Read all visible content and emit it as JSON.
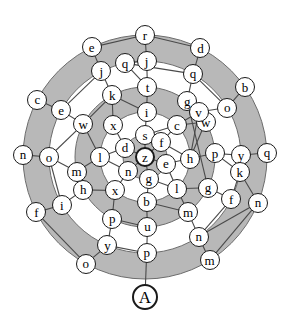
{
  "figure": {
    "colors": {
      "ring_fill": "#b8b8b8",
      "background": "#ffffff",
      "node_fill": "#ffffff",
      "stroke": "#1a1a1a"
    },
    "center": {
      "x": 145,
      "y": 157
    },
    "ring_radii": [
      0,
      22,
      45,
      70,
      96,
      122
    ],
    "goal_radius": 140
  },
  "nodes": [
    {
      "id": "n0",
      "label": "z",
      "ring": 0,
      "angle": 0,
      "bold": true,
      "goal": false
    },
    {
      "id": "n1",
      "label": "s",
      "ring": 1,
      "angle": 270,
      "bold": false,
      "goal": false
    },
    {
      "id": "n2",
      "label": "f",
      "ring": 1,
      "angle": 318,
      "bold": false,
      "goal": false
    },
    {
      "id": "n3",
      "label": "e",
      "ring": 1,
      "angle": 18,
      "bold": false,
      "goal": false
    },
    {
      "id": "n4",
      "label": "g",
      "ring": 1,
      "angle": 80,
      "bold": false,
      "goal": false
    },
    {
      "id": "n5",
      "label": "n",
      "ring": 1,
      "angle": 140,
      "bold": false,
      "goal": false
    },
    {
      "id": "n6",
      "label": "d",
      "ring": 1,
      "angle": 205,
      "bold": false,
      "goal": false
    },
    {
      "id": "n7",
      "label": "i",
      "ring": 2,
      "angle": 272,
      "bold": false,
      "goal": false
    },
    {
      "id": "n8",
      "label": "c",
      "ring": 2,
      "angle": 315,
      "bold": false,
      "goal": false
    },
    {
      "id": "n9",
      "label": "h",
      "ring": 2,
      "angle": 2,
      "bold": false,
      "goal": false
    },
    {
      "id": "n10",
      "label": "l",
      "ring": 2,
      "angle": 45,
      "bold": false,
      "goal": false
    },
    {
      "id": "n11",
      "label": "b",
      "ring": 2,
      "angle": 88,
      "bold": false,
      "goal": false
    },
    {
      "id": "n12",
      "label": "x",
      "ring": 2,
      "angle": 132,
      "bold": false,
      "goal": false
    },
    {
      "id": "n13",
      "label": "l",
      "ring": 2,
      "angle": 180,
      "bold": false,
      "goal": false
    },
    {
      "id": "n14",
      "label": "x",
      "ring": 2,
      "angle": 225,
      "bold": false,
      "goal": false
    },
    {
      "id": "n15",
      "label": "t",
      "ring": 3,
      "angle": 272,
      "bold": false,
      "goal": false
    },
    {
      "id": "n16",
      "label": "g",
      "ring": 3,
      "angle": 307,
      "bold": false,
      "goal": false
    },
    {
      "id": "n17",
      "label": "w",
      "ring": 3,
      "angle": 330,
      "bold": false,
      "goal": false
    },
    {
      "id": "n18",
      "label": "p",
      "ring": 3,
      "angle": 357,
      "bold": false,
      "goal": false
    },
    {
      "id": "n19",
      "label": "g",
      "ring": 3,
      "angle": 26,
      "bold": false,
      "goal": false
    },
    {
      "id": "n20",
      "label": "m",
      "ring": 3,
      "angle": 52,
      "bold": false,
      "goal": false
    },
    {
      "id": "n21",
      "label": "u",
      "ring": 3,
      "angle": 88,
      "bold": false,
      "goal": false
    },
    {
      "id": "n22",
      "label": "p",
      "ring": 3,
      "angle": 118,
      "bold": false,
      "goal": false
    },
    {
      "id": "n23",
      "label": "h",
      "ring": 3,
      "angle": 152,
      "bold": false,
      "goal": false
    },
    {
      "id": "n24",
      "label": "m",
      "ring": 3,
      "angle": 168,
      "bold": false,
      "goal": false
    },
    {
      "id": "n25",
      "label": "w",
      "ring": 3,
      "angle": 208,
      "bold": false,
      "goal": false
    },
    {
      "id": "n26",
      "label": "k",
      "ring": 3,
      "angle": 242,
      "bold": false,
      "goal": false
    },
    {
      "id": "n27",
      "label": "v",
      "ring": 3,
      "angle": 320,
      "bold": false,
      "goal": false
    },
    {
      "id": "n28",
      "label": "j",
      "ring": 4,
      "angle": 271,
      "bold": false,
      "goal": false
    },
    {
      "id": "n29",
      "label": "q",
      "ring": 4,
      "angle": 300,
      "bold": false,
      "goal": false
    },
    {
      "id": "n30",
      "label": "o",
      "ring": 4,
      "angle": 329,
      "bold": false,
      "goal": false
    },
    {
      "id": "n31",
      "label": "y",
      "ring": 4,
      "angle": 359,
      "bold": false,
      "goal": false
    },
    {
      "id": "n32",
      "label": "f",
      "ring": 4,
      "angle": 26,
      "bold": false,
      "goal": false
    },
    {
      "id": "n33",
      "label": "n",
      "ring": 4,
      "angle": 56,
      "bold": false,
      "goal": false
    },
    {
      "id": "n34",
      "label": "p",
      "ring": 4,
      "angle": 89,
      "bold": false,
      "goal": false
    },
    {
      "id": "n35",
      "label": "y",
      "ring": 4,
      "angle": 113,
      "bold": false,
      "goal": false
    },
    {
      "id": "n36",
      "label": "i",
      "ring": 4,
      "angle": 150,
      "bold": false,
      "goal": false
    },
    {
      "id": "n37",
      "label": "o",
      "ring": 4,
      "angle": 180,
      "bold": false,
      "goal": false
    },
    {
      "id": "n38",
      "label": "e",
      "ring": 4,
      "angle": 209,
      "bold": false,
      "goal": false
    },
    {
      "id": "n39",
      "label": "j",
      "ring": 4,
      "angle": 243,
      "bold": false,
      "goal": false
    },
    {
      "id": "n40",
      "label": "q",
      "ring": 4,
      "angle": 258,
      "bold": false,
      "goal": false
    },
    {
      "id": "n41",
      "label": "k",
      "ring": 4,
      "angle": 9,
      "bold": false,
      "goal": false
    },
    {
      "id": "n42",
      "label": "r",
      "ring": 5,
      "angle": 270,
      "bold": false,
      "goal": false
    },
    {
      "id": "n43",
      "label": "d",
      "ring": 5,
      "angle": 297,
      "bold": false,
      "goal": false
    },
    {
      "id": "n44",
      "label": "b",
      "ring": 5,
      "angle": 325,
      "bold": false,
      "goal": false
    },
    {
      "id": "n45",
      "label": "q",
      "ring": 5,
      "angle": 358,
      "bold": false,
      "goal": false
    },
    {
      "id": "n46",
      "label": "n",
      "ring": 5,
      "angle": 22,
      "bold": false,
      "goal": false
    },
    {
      "id": "n47",
      "label": "m",
      "ring": 5,
      "angle": 58,
      "bold": false,
      "goal": false
    },
    {
      "id": "n48",
      "label": "o",
      "ring": 5,
      "angle": 119,
      "bold": false,
      "goal": false
    },
    {
      "id": "n49",
      "label": "f",
      "ring": 5,
      "angle": 153,
      "bold": false,
      "goal": false
    },
    {
      "id": "n50",
      "label": "n",
      "ring": 5,
      "angle": 181,
      "bold": false,
      "goal": false
    },
    {
      "id": "n51",
      "label": "c",
      "ring": 5,
      "angle": 208,
      "bold": false,
      "goal": false
    },
    {
      "id": "n52",
      "label": "e",
      "ring": 5,
      "angle": 244,
      "bold": false,
      "goal": false
    },
    {
      "id": "n53",
      "label": "A",
      "ring": 6,
      "angle": 90,
      "bold": true,
      "goal": true
    }
  ],
  "edges": [
    [
      "n0",
      "n1"
    ],
    [
      "n0",
      "n2"
    ],
    [
      "n0",
      "n3"
    ],
    [
      "n0",
      "n4"
    ],
    [
      "n0",
      "n5"
    ],
    [
      "n0",
      "n6"
    ],
    [
      "n1",
      "n7"
    ],
    [
      "n2",
      "n8"
    ],
    [
      "n3",
      "n9"
    ],
    [
      "n4",
      "n11"
    ],
    [
      "n5",
      "n12"
    ],
    [
      "n6",
      "n14"
    ],
    [
      "n2",
      "n9"
    ],
    [
      "n3",
      "n10"
    ],
    [
      "n4",
      "n10"
    ],
    [
      "n5",
      "n13"
    ],
    [
      "n6",
      "n13"
    ],
    [
      "n1",
      "n8"
    ],
    [
      "n7",
      "n15"
    ],
    [
      "n8",
      "n17"
    ],
    [
      "n9",
      "n18"
    ],
    [
      "n10",
      "n20"
    ],
    [
      "n11",
      "n21"
    ],
    [
      "n12",
      "n22"
    ],
    [
      "n13",
      "n24"
    ],
    [
      "n14",
      "n26"
    ],
    [
      "n7",
      "n26"
    ],
    [
      "n9",
      "n27"
    ],
    [
      "n8",
      "n27"
    ],
    [
      "n10",
      "n19"
    ],
    [
      "n12",
      "n23"
    ],
    [
      "n13",
      "n25"
    ],
    [
      "n11",
      "n20"
    ],
    [
      "n15",
      "n28"
    ],
    [
      "n16",
      "n29"
    ],
    [
      "n17",
      "n27"
    ],
    [
      "n18",
      "n31"
    ],
    [
      "n19",
      "n32"
    ],
    [
      "n20",
      "n33"
    ],
    [
      "n21",
      "n34"
    ],
    [
      "n22",
      "n35"
    ],
    [
      "n23",
      "n36"
    ],
    [
      "n24",
      "n23"
    ],
    [
      "n25",
      "n38"
    ],
    [
      "n26",
      "n39"
    ],
    [
      "n15",
      "n40"
    ],
    [
      "n27",
      "n30"
    ],
    [
      "n16",
      "n19"
    ],
    [
      "n25",
      "n37"
    ],
    [
      "n24",
      "n37"
    ],
    [
      "n18",
      "n41"
    ],
    [
      "n28",
      "n42"
    ],
    [
      "n29",
      "n43"
    ],
    [
      "n30",
      "n44"
    ],
    [
      "n31",
      "n45"
    ],
    [
      "n41",
      "n46"
    ],
    [
      "n33",
      "n47"
    ],
    [
      "n35",
      "n48"
    ],
    [
      "n36",
      "n49"
    ],
    [
      "n37",
      "n50"
    ],
    [
      "n38",
      "n51"
    ],
    [
      "n39",
      "n52"
    ],
    [
      "n40",
      "n28"
    ],
    [
      "n29",
      "n40"
    ],
    [
      "n32",
      "n41"
    ],
    [
      "n34",
      "n35"
    ],
    [
      "n33",
      "n46"
    ],
    [
      "n34",
      "n53"
    ],
    [
      "n30",
      "n29"
    ],
    [
      "n31",
      "n41"
    ],
    [
      "n36",
      "n37"
    ],
    [
      "n52",
      "n42"
    ],
    [
      "n43",
      "n42"
    ],
    [
      "n48",
      "n49"
    ],
    [
      "n47",
      "n46"
    ],
    [
      "n38",
      "n39"
    ],
    [
      "n32",
      "n33"
    ],
    [
      "n21",
      "n22"
    ],
    [
      "n16",
      "n27"
    ],
    [
      "n17",
      "n9"
    ],
    [
      "n26",
      "n25"
    ]
  ]
}
